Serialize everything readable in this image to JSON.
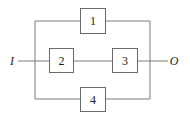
{
  "diagram": {
    "title": "",
    "input_label": "I",
    "output_label": "O",
    "blocks": [
      {
        "id": "1",
        "label": "1"
      },
      {
        "id": "2",
        "label": "2"
      },
      {
        "id": "3",
        "label": "3"
      },
      {
        "id": "4",
        "label": "4"
      }
    ],
    "edges": [
      {
        "from": "I",
        "to": "2"
      },
      {
        "from": "2",
        "to": "3"
      },
      {
        "from": "3",
        "to": "O"
      },
      {
        "from": "I",
        "to": "1"
      },
      {
        "from": "1",
        "to": "O"
      },
      {
        "from": "I",
        "to": "4"
      },
      {
        "from": "4",
        "to": "O"
      }
    ],
    "colors": {
      "line": "#7a7a7a",
      "box": "#6a6a6a",
      "text": "#222222"
    }
  }
}
